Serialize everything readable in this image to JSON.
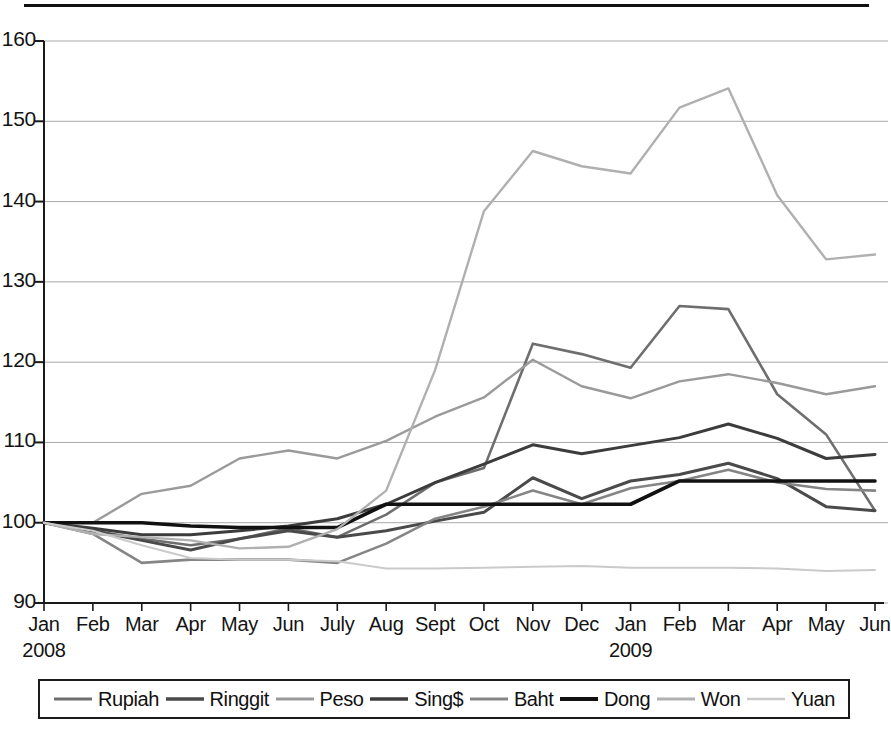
{
  "figure": {
    "has_top_rule": true
  },
  "chart_data": {
    "type": "line",
    "title": "",
    "subtitle": "",
    "xlabel": "",
    "ylabel": "",
    "grid": true,
    "grid_axis": "y",
    "legend_position": "bottom",
    "index_base": 100,
    "xlim_categories": 18,
    "ylim": [
      90,
      160
    ],
    "ytick_step": 10,
    "yticks": [
      90,
      100,
      110,
      120,
      130,
      140,
      150,
      160
    ],
    "ytick_labels": [
      "90",
      "100",
      "110",
      "120",
      "130",
      "140",
      "150",
      "160"
    ],
    "categories": [
      "Jan",
      "Feb",
      "Mar",
      "Apr",
      "May",
      "Jun",
      "July",
      "Aug",
      "Sept",
      "Oct",
      "Nov",
      "Dec",
      "Jan",
      "Feb",
      "Mar",
      "Apr",
      "May",
      "Jun"
    ],
    "year_markers": [
      {
        "index": 0,
        "label": "2008"
      },
      {
        "index": 12,
        "label": "2009"
      }
    ],
    "series": [
      {
        "name": "Rupiah",
        "color": "#6e6e6e",
        "width": 2.6,
        "values": [
          100,
          99.0,
          98.0,
          97.2,
          98.0,
          99.3,
          98.2,
          101.0,
          105.0,
          106.8,
          122.3,
          121.0,
          119.3,
          127.0,
          126.6,
          116.0,
          111.0,
          101.5
        ]
      },
      {
        "name": "Ringgit",
        "color": "#4a4a4a",
        "width": 3.0,
        "values": [
          100,
          99.0,
          97.8,
          96.6,
          98.0,
          99.0,
          98.2,
          99.0,
          100.2,
          101.3,
          105.6,
          103.0,
          105.2,
          106.0,
          107.4,
          105.5,
          102.0,
          101.5
        ]
      },
      {
        "name": "Peso",
        "color": "#9a9a9a",
        "width": 2.4,
        "values": [
          100,
          100.0,
          103.6,
          104.6,
          108.0,
          109.0,
          108.0,
          110.2,
          113.2,
          115.6,
          120.3,
          117.0,
          115.5,
          117.6,
          118.5,
          117.4,
          116.0,
          117.0
        ]
      },
      {
        "name": "Sing$",
        "color": "#3c3c3c",
        "width": 3.0,
        "values": [
          100,
          99.3,
          98.5,
          98.5,
          99.0,
          99.6,
          100.5,
          102.3,
          105.0,
          107.3,
          109.7,
          108.6,
          109.6,
          110.6,
          112.3,
          110.5,
          108.0,
          108.5
        ]
      },
      {
        "name": "Baht",
        "color": "#858585",
        "width": 2.6,
        "values": [
          100,
          98.6,
          95.0,
          95.4,
          95.4,
          95.4,
          95.0,
          97.4,
          100.5,
          102.0,
          104.0,
          102.3,
          104.3,
          105.2,
          106.6,
          105.0,
          104.2,
          104.0
        ]
      },
      {
        "name": "Dong",
        "color": "#111111",
        "width": 3.6,
        "values": [
          100,
          100.0,
          100.0,
          99.6,
          99.4,
          99.4,
          99.4,
          102.3,
          102.3,
          102.3,
          102.3,
          102.3,
          102.3,
          105.2,
          105.2,
          105.2,
          105.2,
          105.2
        ]
      },
      {
        "name": "Won",
        "color": "#b0b0b0",
        "width": 2.4,
        "values": [
          100,
          98.6,
          98.2,
          97.8,
          96.8,
          97.0,
          99.2,
          104.0,
          119.0,
          138.8,
          146.3,
          144.4,
          143.5,
          151.7,
          154.1,
          140.8,
          132.8,
          133.4
        ]
      },
      {
        "name": "Yuan",
        "color": "#cacaca",
        "width": 2.0,
        "values": [
          100,
          99.0,
          97.2,
          95.6,
          95.4,
          95.4,
          95.2,
          94.3,
          94.3,
          94.4,
          94.5,
          94.6,
          94.4,
          94.4,
          94.4,
          94.3,
          94.0,
          94.1
        ]
      }
    ]
  },
  "legend": {
    "entries": [
      {
        "label": "Rupiah"
      },
      {
        "label": "Ringgit"
      },
      {
        "label": "Peso"
      },
      {
        "label": "Sing$"
      },
      {
        "label": "Baht"
      },
      {
        "label": "Dong"
      },
      {
        "label": "Won"
      },
      {
        "label": "Yuan"
      }
    ]
  }
}
